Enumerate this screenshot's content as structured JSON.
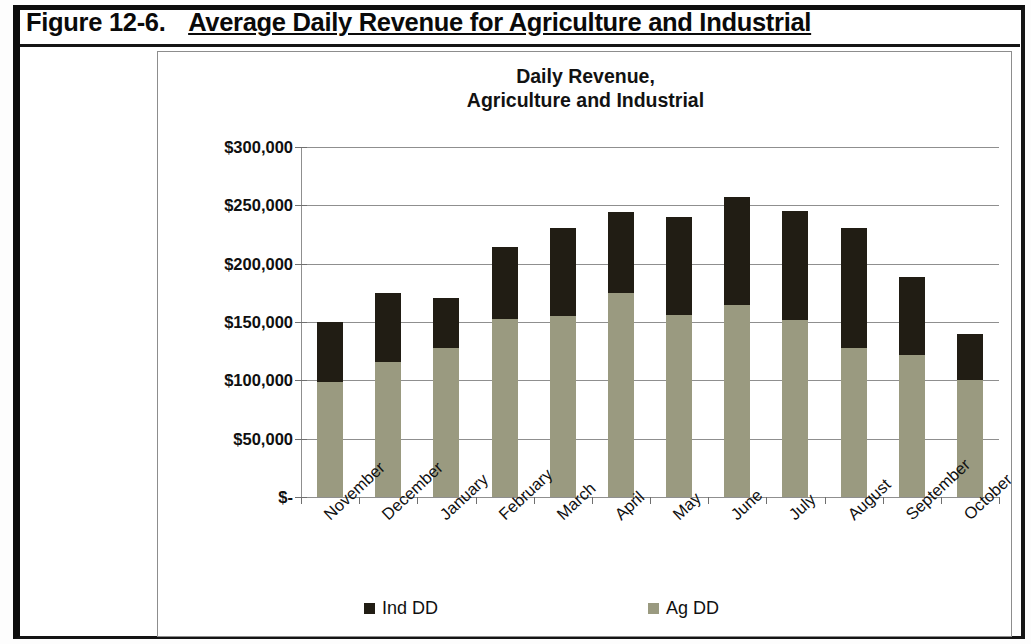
{
  "figure": {
    "number": "Figure 12-6.",
    "caption": "Average Daily Revenue for Agriculture and Industrial"
  },
  "chart_data": {
    "type": "bar",
    "subtype": "stacked-vertical",
    "title": "Daily Revenue,\nAgriculture and Industrial",
    "title_line1": "Daily Revenue,",
    "title_line2": "Agriculture and Industrial",
    "xlabel": "",
    "ylabel": "",
    "categories": [
      "November",
      "December",
      "January",
      "February",
      "March",
      "April",
      "May",
      "June",
      "July",
      "August",
      "September",
      "October"
    ],
    "series": [
      {
        "name": "Ag DD",
        "color": "#9a9a80",
        "values": [
          99000,
          116000,
          128000,
          153000,
          155000,
          175000,
          156000,
          165000,
          152000,
          128000,
          122000,
          100000
        ]
      },
      {
        "name": "Ind DD",
        "color": "#211d14",
        "values": [
          51000,
          59000,
          43000,
          61000,
          76000,
          69000,
          84000,
          92000,
          93000,
          103000,
          67000,
          40000
        ]
      }
    ],
    "totals": [
      150000,
      175000,
      171000,
      214000,
      231000,
      244000,
      240000,
      257000,
      245000,
      231000,
      189000,
      140000
    ],
    "ylim": [
      0,
      300000
    ],
    "ytick_values": [
      0,
      50000,
      100000,
      150000,
      200000,
      250000,
      300000
    ],
    "ytick_labels": [
      "$-",
      "$50,000",
      "$100,000",
      "$150,000",
      "$200,000",
      "$250,000",
      "$300,000"
    ],
    "grid": true,
    "grid_axis": "y",
    "legend_position": "bottom",
    "legend_entries": [
      "Ind DD",
      "Ag DD"
    ],
    "xlabel_rotation": -43
  }
}
